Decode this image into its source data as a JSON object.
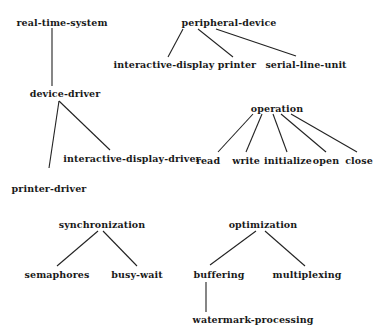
{
  "diagram": {
    "type": "tree-forest",
    "line_color": "#222222",
    "text_color": "#1a1a1a",
    "nodes": {
      "real_time_system": {
        "label": "real-time-system",
        "x": 62,
        "y": 22
      },
      "device_driver": {
        "label": "device-driver",
        "x": 65,
        "y": 93
      },
      "printer_driver": {
        "label": "printer-driver",
        "x": 49,
        "y": 188
      },
      "interactive_display_driver": {
        "label": "interactive-display-driver",
        "x": 132,
        "y": 158
      },
      "peripheral_device": {
        "label": "peripheral-device",
        "x": 229,
        "y": 22
      },
      "interactive_display": {
        "label": "interactive-display",
        "x": 164,
        "y": 64
      },
      "printer": {
        "label": "printer",
        "x": 237,
        "y": 64
      },
      "serial_line_unit": {
        "label": "serial-line-unit",
        "x": 306,
        "y": 64
      },
      "operation": {
        "label": "operation",
        "x": 277,
        "y": 108
      },
      "read": {
        "label": "read",
        "x": 208,
        "y": 160
      },
      "write": {
        "label": "write",
        "x": 246,
        "y": 160
      },
      "initialize": {
        "label": "initialize",
        "x": 288,
        "y": 160
      },
      "open": {
        "label": "open",
        "x": 326,
        "y": 160
      },
      "close": {
        "label": "close",
        "x": 359,
        "y": 160
      },
      "synchronization": {
        "label": "synchronization",
        "x": 102,
        "y": 224
      },
      "semaphores": {
        "label": "semaphores",
        "x": 57,
        "y": 274
      },
      "busy_wait": {
        "label": "busy-wait",
        "x": 137,
        "y": 274
      },
      "optimization": {
        "label": "optimization",
        "x": 263,
        "y": 224
      },
      "buffering": {
        "label": "buffering",
        "x": 219,
        "y": 274
      },
      "multiplexing": {
        "label": "multiplexing",
        "x": 307,
        "y": 274
      },
      "watermark_processing": {
        "label": "watermark-processing",
        "x": 253,
        "y": 319
      }
    },
    "edges": [
      {
        "from": "real_time_system",
        "to": "device_driver",
        "x1": 52,
        "y1": 28,
        "x2": 52,
        "y2": 86
      },
      {
        "from": "device_driver",
        "to": "printer_driver",
        "x1": 59,
        "y1": 101,
        "x2": 49,
        "y2": 168
      },
      {
        "from": "device_driver",
        "to": "interactive_display_driver",
        "x1": 59,
        "y1": 101,
        "x2": 110,
        "y2": 150
      },
      {
        "from": "peripheral_device",
        "to": "interactive_display",
        "x1": 183,
        "y1": 29,
        "x2": 168,
        "y2": 57
      },
      {
        "from": "peripheral_device",
        "to": "printer",
        "x1": 198,
        "y1": 29,
        "x2": 233,
        "y2": 57
      },
      {
        "from": "peripheral_device",
        "to": "serial_line_unit",
        "x1": 216,
        "y1": 29,
        "x2": 296,
        "y2": 56
      },
      {
        "from": "operation",
        "to": "read",
        "x1": 253,
        "y1": 114,
        "x2": 218,
        "y2": 152
      },
      {
        "from": "operation",
        "to": "write",
        "x1": 262,
        "y1": 114,
        "x2": 246,
        "y2": 152
      },
      {
        "from": "operation",
        "to": "initialize",
        "x1": 273,
        "y1": 114,
        "x2": 287,
        "y2": 152
      },
      {
        "from": "operation",
        "to": "open",
        "x1": 281,
        "y1": 114,
        "x2": 326,
        "y2": 152
      },
      {
        "from": "operation",
        "to": "close",
        "x1": 291,
        "y1": 114,
        "x2": 357,
        "y2": 152
      },
      {
        "from": "synchronization",
        "to": "semaphores",
        "x1": 98,
        "y1": 231,
        "x2": 57,
        "y2": 266
      },
      {
        "from": "synchronization",
        "to": "busy_wait",
        "x1": 103,
        "y1": 231,
        "x2": 137,
        "y2": 266
      },
      {
        "from": "optimization",
        "to": "buffering",
        "x1": 256,
        "y1": 231,
        "x2": 210,
        "y2": 265
      },
      {
        "from": "optimization",
        "to": "multiplexing",
        "x1": 265,
        "y1": 231,
        "x2": 305,
        "y2": 266
      },
      {
        "from": "buffering",
        "to": "watermark_processing",
        "x1": 206,
        "y1": 282,
        "x2": 206,
        "y2": 312
      }
    ]
  }
}
